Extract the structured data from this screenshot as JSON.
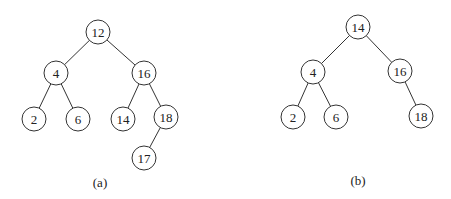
{
  "figure": {
    "trees": [
      {
        "caption": "(a)",
        "nodes": [
          {
            "id": "a12",
            "label": "12",
            "x": 98,
            "y": 32
          },
          {
            "id": "a4",
            "label": "4",
            "x": 56,
            "y": 73
          },
          {
            "id": "a16",
            "label": "16",
            "x": 144,
            "y": 73
          },
          {
            "id": "a2",
            "label": "2",
            "x": 34,
            "y": 119
          },
          {
            "id": "a6",
            "label": "6",
            "x": 78,
            "y": 119
          },
          {
            "id": "a14",
            "label": "14",
            "x": 123,
            "y": 119
          },
          {
            "id": "a18",
            "label": "18",
            "x": 166,
            "y": 117
          },
          {
            "id": "a17",
            "label": "17",
            "x": 144,
            "y": 158
          }
        ],
        "edges": [
          [
            "a12",
            "a4"
          ],
          [
            "a12",
            "a16"
          ],
          [
            "a4",
            "a2"
          ],
          [
            "a4",
            "a6"
          ],
          [
            "a16",
            "a14"
          ],
          [
            "a16",
            "a18"
          ],
          [
            "a18",
            "a17"
          ]
        ]
      },
      {
        "caption": "(b)",
        "nodes": [
          {
            "id": "b14",
            "label": "14",
            "x": 358,
            "y": 27
          },
          {
            "id": "b4",
            "label": "4",
            "x": 313,
            "y": 72
          },
          {
            "id": "b16",
            "label": "16",
            "x": 400,
            "y": 71
          },
          {
            "id": "b2",
            "label": "2",
            "x": 293,
            "y": 117
          },
          {
            "id": "b6",
            "label": "6",
            "x": 336,
            "y": 117
          },
          {
            "id": "b18",
            "label": "18",
            "x": 421,
            "y": 116
          }
        ],
        "edges": [
          [
            "b14",
            "b4"
          ],
          [
            "b14",
            "b16"
          ],
          [
            "b4",
            "b2"
          ],
          [
            "b4",
            "b6"
          ],
          [
            "b16",
            "b18"
          ]
        ]
      }
    ]
  }
}
